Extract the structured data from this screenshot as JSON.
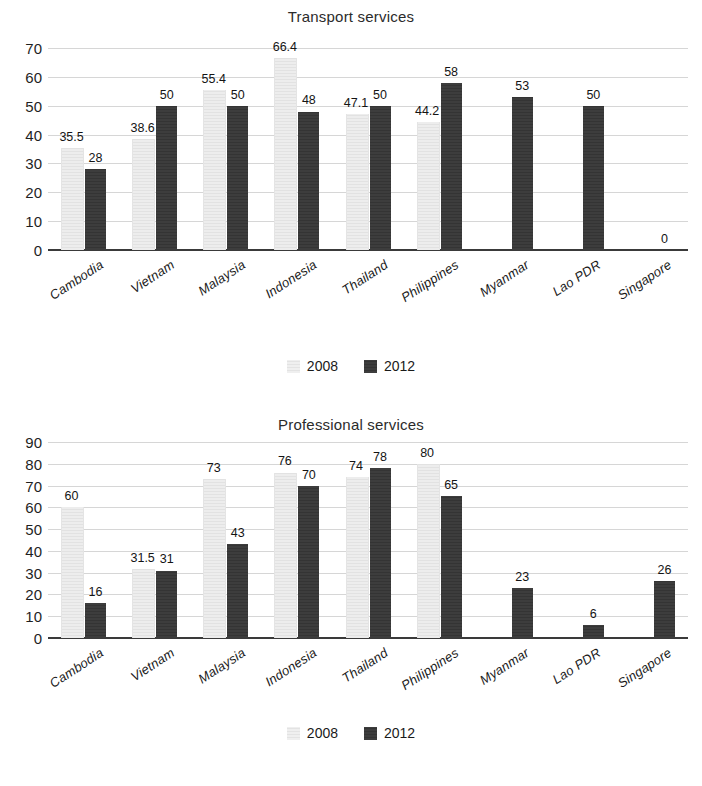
{
  "legend": {
    "entries": [
      {
        "label": "2008",
        "color": "#eaeaea"
      },
      {
        "label": "2012",
        "color": "#3a3a3a"
      }
    ]
  },
  "chart_data": [
    {
      "type": "bar",
      "title": "Transport services",
      "xlabel": "",
      "ylabel": "",
      "ylim": [
        0,
        70
      ],
      "yticks": [
        0,
        10,
        20,
        30,
        40,
        50,
        60,
        70
      ],
      "grid": true,
      "legend_position": "bottom",
      "categories": [
        "Cambodia",
        "Vietnam",
        "Malaysia",
        "Indonesia",
        "Thailand",
        "Philippines",
        "Myanmar",
        "Lao PDR",
        "Singapore"
      ],
      "series": [
        {
          "name": "2008",
          "color": "#eaeaea",
          "values": [
            35.5,
            38.6,
            55.4,
            66.4,
            47.1,
            44.2,
            null,
            null,
            null
          ],
          "labels": [
            "35.5",
            "38.6",
            "55.4",
            "66.4",
            "47.1",
            "44.2",
            "",
            "",
            ""
          ]
        },
        {
          "name": "2012",
          "color": "#3a3a3a",
          "values": [
            28,
            50,
            50,
            48,
            50,
            58,
            53,
            50,
            0
          ],
          "labels": [
            "28",
            "50",
            "50",
            "48",
            "50",
            "58",
            "53",
            "50",
            "0"
          ]
        }
      ]
    },
    {
      "type": "bar",
      "title": "Professional services",
      "xlabel": "",
      "ylabel": "",
      "ylim": [
        0,
        90
      ],
      "yticks": [
        0,
        10,
        20,
        30,
        40,
        50,
        60,
        70,
        80,
        90
      ],
      "grid": true,
      "legend_position": "bottom",
      "categories": [
        "Cambodia",
        "Vietnam",
        "Malaysia",
        "Indonesia",
        "Thailand",
        "Philippines",
        "Myanmar",
        "Lao PDR",
        "Singapore"
      ],
      "series": [
        {
          "name": "2008",
          "color": "#eaeaea",
          "values": [
            60,
            31.5,
            73,
            76,
            74,
            80,
            null,
            null,
            null
          ],
          "labels": [
            "60",
            "31.5",
            "73",
            "76",
            "74",
            "80",
            "",
            "",
            ""
          ]
        },
        {
          "name": "2012",
          "color": "#3a3a3a",
          "values": [
            16,
            31,
            43,
            70,
            78,
            65,
            23,
            6,
            26
          ],
          "labels": [
            "16",
            "31",
            "43",
            "70",
            "78",
            "65",
            "23",
            "6",
            "26"
          ]
        }
      ]
    }
  ]
}
